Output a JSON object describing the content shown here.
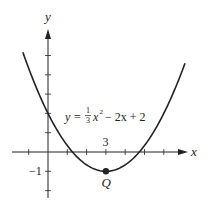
{
  "chart_data": {
    "type": "line",
    "title": "",
    "equation": "y = (1/3)x^2 - 2x + 2",
    "equation_label": {
      "y": "y",
      "eq": "=",
      "frac_num": "1",
      "frac_den": "3",
      "x": "x",
      "exp": "2",
      "rest": "− 2x + 2"
    },
    "xlabel": "x",
    "ylabel": "y",
    "xlim": [
      -1.3,
      7.1
    ],
    "ylim": [
      -2,
      6
    ],
    "x_ticks": [
      -1,
      1,
      2,
      3,
      4,
      5,
      6
    ],
    "y_ticks": [
      -2,
      -1,
      1,
      2,
      3,
      4,
      5
    ],
    "tick_labels": [
      {
        "axis": "x",
        "value": 3,
        "text": "3"
      },
      {
        "axis": "y",
        "value": -1,
        "text": "−1"
      }
    ],
    "coefficients": {
      "a": 0.3333333,
      "b": -2,
      "c": 2
    },
    "points": [
      {
        "name": "Q",
        "x": 3,
        "y": -1
      }
    ],
    "grid": false,
    "colors": {
      "curve": "#222222",
      "axis": "#222222"
    }
  }
}
